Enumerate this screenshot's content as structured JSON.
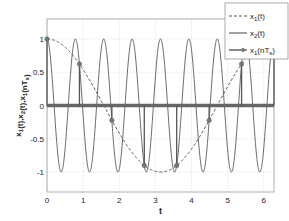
{
  "chart_data": {
    "type": "line",
    "title": "",
    "xlabel": "t",
    "ylabel": "x1(t),x2(t),x1(nTs)",
    "xlim": [
      0,
      6.2832
    ],
    "ylim": [
      -1.3,
      1.3
    ],
    "xticks": [
      "0",
      "1",
      "2",
      "3",
      "4",
      "5",
      "6"
    ],
    "yticks": [
      "-1",
      "-0.5",
      "0",
      "0.5",
      "1"
    ],
    "grid": true,
    "legend_position": "upper right",
    "series": [
      {
        "name": "x1(t)",
        "style": "dashed",
        "function": "cos(t)"
      },
      {
        "name": "x2(t)",
        "style": "solid",
        "function": "cos(8t)"
      },
      {
        "name": "x1(nTs)",
        "style": "stem",
        "x": [
          0,
          0.898,
          1.795,
          2.693,
          3.59,
          4.488,
          5.386,
          6.283
        ],
        "values": [
          1,
          0.623,
          -0.223,
          -0.901,
          -0.901,
          -0.223,
          0.623,
          1
        ]
      }
    ]
  },
  "legend": [
    {
      "label": "x",
      "sub": "1",
      "suffix": "(t)"
    },
    {
      "label": "x",
      "sub": "2",
      "suffix": "(t)"
    },
    {
      "label": "x",
      "sub": "1",
      "suffix": "(nT",
      "sub2": "s",
      "end": ")"
    }
  ]
}
